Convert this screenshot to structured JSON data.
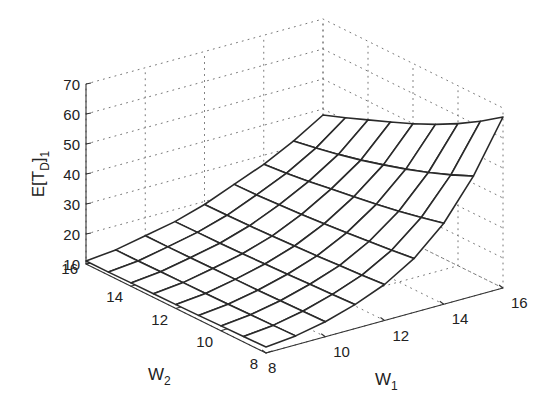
{
  "chart_data": {
    "type": "surface",
    "title": "",
    "xlabel": "W",
    "xlabel_sub": "1",
    "ylabel": "W",
    "ylabel_sub": "2",
    "zlabel": "E[T",
    "zlabel_sub": "D",
    "zlabel_close": "]",
    "zlabel_sub2": "1",
    "x_ticks": [
      8,
      10,
      12,
      14,
      16
    ],
    "y_ticks": [
      8,
      10,
      12,
      14,
      16
    ],
    "z_ticks": [
      10,
      20,
      30,
      40,
      50,
      60,
      70
    ],
    "xlim": [
      8,
      16
    ],
    "ylim": [
      8,
      16
    ],
    "zlim": [
      10,
      70
    ],
    "grid": true,
    "x": [
      8,
      9,
      10,
      11,
      12,
      13,
      14,
      15,
      16
    ],
    "y": [
      8,
      9,
      10,
      11,
      12,
      13,
      14,
      15,
      16
    ],
    "edge_W2_8": [
      12,
      13,
      15,
      18,
      22,
      28,
      37,
      50,
      67
    ],
    "edge_W2_16": [
      11,
      12,
      14,
      16,
      19,
      23,
      27,
      32,
      38
    ],
    "z": [
      [
        12.0,
        11.8,
        11.6,
        11.4,
        11.3,
        11.2,
        11.1,
        11.0,
        11.0
      ],
      [
        13.0,
        12.8,
        12.6,
        12.4,
        12.3,
        12.2,
        12.1,
        12.0,
        12.0
      ],
      [
        15.0,
        14.8,
        14.6,
        14.4,
        14.3,
        14.2,
        14.1,
        14.0,
        14.0
      ],
      [
        18.0,
        17.7,
        17.4,
        17.0,
        16.7,
        16.4,
        16.2,
        16.1,
        16.0
      ],
      [
        22.0,
        21.4,
        20.9,
        20.4,
        20.0,
        19.6,
        19.3,
        19.1,
        19.0
      ],
      [
        28.0,
        27.0,
        26.2,
        25.4,
        24.7,
        24.1,
        23.6,
        23.2,
        23.0
      ],
      [
        37.0,
        35.2,
        33.6,
        32.2,
        31.0,
        29.9,
        28.7,
        27.7,
        27.0
      ],
      [
        50.0,
        46.7,
        43.8,
        41.2,
        38.9,
        36.8,
        35.0,
        33.4,
        32.0
      ],
      [
        67.0,
        61.9,
        57.4,
        53.4,
        49.9,
        46.8,
        43.8,
        40.8,
        38.0
      ]
    ],
    "z_note": "z[i][j]: i indexes W1 (8..16), j indexes W2 (8..16)"
  }
}
